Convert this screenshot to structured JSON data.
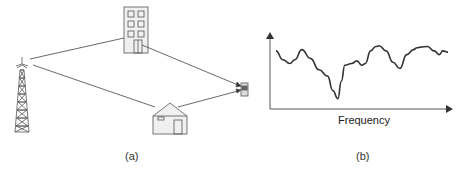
{
  "figure": {
    "panels": [
      {
        "id": "a",
        "caption": "(a)",
        "description": "Multipath propagation: signal from a transmission tower reaches a mobile phone via reflections off a tall building and a house",
        "elements": [
          "cell-tower",
          "tall-building",
          "house",
          "mobile-phone"
        ],
        "paths": [
          {
            "from": "cell-tower",
            "via": "tall-building",
            "to": "mobile-phone"
          },
          {
            "from": "cell-tower",
            "via": "house",
            "to": "mobile-phone"
          }
        ]
      },
      {
        "id": "b",
        "caption": "(b)",
        "xlabel": "Frequency",
        "ylabel": "",
        "description": "Frequency-selective fading response curve"
      }
    ]
  },
  "chart_data": {
    "type": "line",
    "title": "",
    "xlabel": "Frequency",
    "ylabel": "",
    "grid": false,
    "legend": "none",
    "x": [
      0,
      0.04,
      0.08,
      0.11,
      0.15,
      0.2,
      0.25,
      0.3,
      0.33,
      0.36,
      0.38,
      0.4,
      0.44,
      0.47,
      0.5,
      0.52,
      0.55,
      0.58,
      0.6,
      0.64,
      0.68,
      0.72,
      0.76,
      0.8,
      0.82,
      0.84,
      0.88,
      0.92,
      0.95,
      0.97,
      1.0
    ],
    "values": [
      0.78,
      0.64,
      0.58,
      0.64,
      0.8,
      0.66,
      0.48,
      0.38,
      0.15,
      0.02,
      0.3,
      0.55,
      0.58,
      0.62,
      0.55,
      0.58,
      0.78,
      0.85,
      0.86,
      0.78,
      0.6,
      0.5,
      0.72,
      0.8,
      0.83,
      0.84,
      0.85,
      0.78,
      0.72,
      0.78,
      0.76
    ]
  }
}
